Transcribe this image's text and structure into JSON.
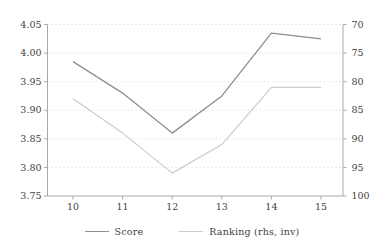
{
  "figure": {
    "background_color": "#ffffff",
    "label_color": "#3f3f3f",
    "axis_color": "#a9a9a9",
    "grid_color": "#e3e3e3"
  },
  "chart_data": {
    "type": "line",
    "title": "",
    "xlabel": "",
    "ylabel": "",
    "x": [
      10,
      11,
      12,
      13,
      14,
      15
    ],
    "x_tick_labels": [
      "10",
      "11",
      "12",
      "13",
      "14",
      "15"
    ],
    "series": [
      {
        "name": "Score",
        "axis": "left",
        "color": "#8f8f8f",
        "width": 1.3,
        "values": [
          3.985,
          3.93,
          3.86,
          3.925,
          4.035,
          4.025
        ]
      },
      {
        "name": "Ranking (rhs, inv)",
        "axis": "right",
        "color": "#cccccc",
        "width": 1.2,
        "values": [
          83,
          89,
          96,
          91,
          81,
          81
        ]
      }
    ],
    "left_axis": {
      "min": 3.75,
      "max": 4.05,
      "ticks": [
        4.05,
        4.0,
        3.95,
        3.9,
        3.85,
        3.8,
        3.75
      ],
      "tick_labels": [
        "4.05",
        "4.00",
        "3.95",
        "3.90",
        "3.85",
        "3.80",
        "3.75"
      ]
    },
    "right_axis": {
      "min": 70,
      "max": 100,
      "inverted": true,
      "ticks": [
        70,
        75,
        80,
        85,
        90,
        95,
        100
      ],
      "tick_labels": [
        "70",
        "75",
        "80",
        "85",
        "90",
        "95",
        "100"
      ]
    },
    "grid": true,
    "legend_position": "bottom",
    "legend": [
      "Score",
      "Ranking (rhs, inv)"
    ]
  }
}
